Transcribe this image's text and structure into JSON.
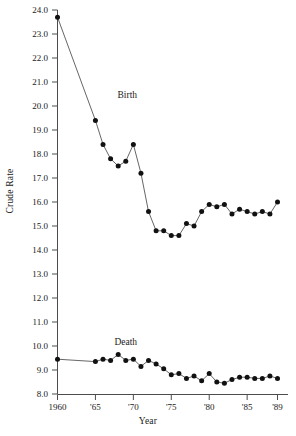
{
  "chart_data": {
    "type": "line",
    "title": "",
    "xlabel": "Year",
    "ylabel": "Crude Rate",
    "xlim": [
      1960,
      1989
    ],
    "ylim": [
      8.0,
      24.0
    ],
    "grid": false,
    "legend": "inline-annotations",
    "x_tick_labels": [
      "1960",
      "'65",
      "'70",
      "'75",
      "'80",
      "'85",
      "'89"
    ],
    "x_tick_values": [
      1960,
      1965,
      1970,
      1975,
      1980,
      1985,
      1989
    ],
    "y_tick_labels": [
      "8.0",
      "9.0",
      "10.0",
      "11.0",
      "12.0",
      "13.0",
      "14.0",
      "15.0",
      "16.0",
      "17.0",
      "18.0",
      "19.0",
      "20.0",
      "21.0",
      "22.0",
      "23.0",
      "24.0"
    ],
    "y_tick_values": [
      8.0,
      9.0,
      10.0,
      11.0,
      12.0,
      13.0,
      14.0,
      15.0,
      16.0,
      17.0,
      18.0,
      19.0,
      20.0,
      21.0,
      22.0,
      23.0,
      24.0
    ],
    "series": [
      {
        "name": "Birth",
        "annotation": "Birth",
        "annotation_x": 1969.2,
        "annotation_y": 20.35,
        "color": "#111111",
        "x": [
          1960,
          1965,
          1966,
          1967,
          1968,
          1969,
          1970,
          1971,
          1972,
          1973,
          1974,
          1975,
          1976,
          1977,
          1978,
          1979,
          1980,
          1981,
          1982,
          1983,
          1984,
          1985,
          1986,
          1987,
          1988,
          1989
        ],
        "values": [
          23.7,
          19.4,
          18.4,
          17.8,
          17.5,
          17.7,
          18.4,
          17.2,
          15.6,
          14.8,
          14.8,
          14.6,
          14.6,
          15.1,
          15.0,
          15.6,
          15.9,
          15.8,
          15.9,
          15.5,
          15.7,
          15.6,
          15.5,
          15.6,
          15.5,
          16.0
        ]
      },
      {
        "name": "Death",
        "annotation": "Death",
        "annotation_x": 1969.0,
        "annotation_y": 10.05,
        "color": "#111111",
        "x": [
          1960,
          1965,
          1966,
          1967,
          1968,
          1969,
          1970,
          1971,
          1972,
          1973,
          1974,
          1975,
          1976,
          1977,
          1978,
          1979,
          1980,
          1981,
          1982,
          1983,
          1984,
          1985,
          1986,
          1987,
          1988,
          1989
        ],
        "values": [
          9.45,
          9.35,
          9.45,
          9.4,
          9.65,
          9.4,
          9.45,
          9.15,
          9.4,
          9.25,
          9.05,
          8.8,
          8.85,
          8.65,
          8.75,
          8.55,
          8.85,
          8.5,
          8.45,
          8.6,
          8.7,
          8.7,
          8.65,
          8.65,
          8.75,
          8.65
        ]
      }
    ]
  },
  "figure": {
    "axis_color": "#4d4d4d",
    "line_color": "#555555",
    "marker_color": "#111111"
  }
}
